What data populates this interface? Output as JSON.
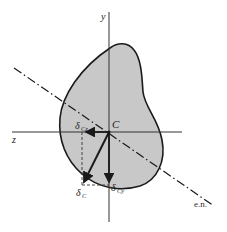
{
  "figure": {
    "colors": {
      "section_fill": "#c8c8c8",
      "outline": "#1a1a1a",
      "background": "#ffffff"
    },
    "labels": {
      "y_axis": "y",
      "z_axis": "z",
      "centroid": "C",
      "neutral_axis": "e.n.",
      "delta_symbol": "δ",
      "delta_c_sub": "C",
      "delta_cz_sub": "Cz",
      "delta_cy_sub": "Cy"
    },
    "elements": {
      "section": "irregular-shaded-section",
      "axes": [
        "y-axis",
        "z-axis"
      ],
      "neutral_axis_style": "dash-dot",
      "vectors": [
        "delta-C",
        "delta-Cz",
        "delta-Cy"
      ]
    }
  }
}
